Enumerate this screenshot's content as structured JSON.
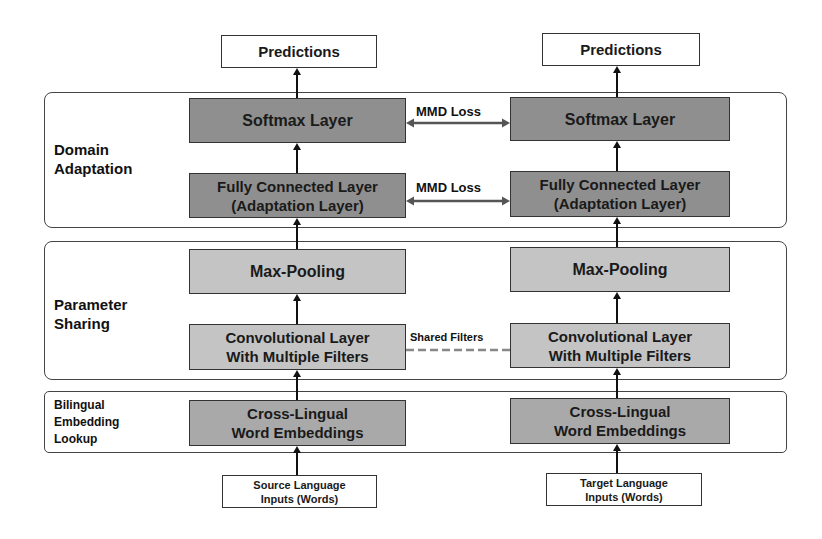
{
  "diagram": {
    "type": "architecture-diagram",
    "panels": [
      {
        "id": "domain-adaptation",
        "label": "Domain\nAdaptation"
      },
      {
        "id": "parameter-sharing",
        "label": "Parameter\nSharing"
      },
      {
        "id": "bilingual-embedding-lookup",
        "label": "Bilingual\nEmbedding\nLookup"
      }
    ],
    "source_column": {
      "output": "Predictions",
      "softmax": "Softmax Layer",
      "fully_connected": "Fully Connected Layer\n(Adaptation Layer)",
      "max_pooling": "Max-Pooling",
      "convolutional": "Convolutional Layer\nWith Multiple Filters",
      "embeddings": "Cross-Lingual\nWord Embeddings",
      "input": "Source Language\nInputs (Words)"
    },
    "target_column": {
      "output": "Predictions",
      "softmax": "Softmax Layer",
      "fully_connected": "Fully Connected Layer\n(Adaptation Layer)",
      "max_pooling": "Max-Pooling",
      "convolutional": "Convolutional Layer\nWith Multiple Filters",
      "embeddings": "Cross-Lingual\nWord Embeddings",
      "input": "Target Language\nInputs (Words)"
    },
    "connectors": {
      "softmax_link": "MMD Loss",
      "fc_link": "MMD Loss",
      "conv_link": "Shared Filters"
    },
    "colors": {
      "dark_box": "#8f8f8f",
      "light_box": "#c4c4c4",
      "mid_box": "#a9a9a9",
      "line": "#111111",
      "dashed_link": "#888888"
    }
  }
}
